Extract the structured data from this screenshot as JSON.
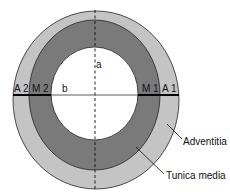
{
  "diagram": {
    "colors": {
      "adventitia": "#c4c4c4",
      "tunica_media": "#7a7a7a",
      "lumen": "#ffffff",
      "stroke": "#222222"
    },
    "layers": [
      {
        "name": "Adventitia",
        "cx": 96,
        "cy": 100,
        "rx": 83,
        "ry": 89
      },
      {
        "name": "Tunica media",
        "cx": 94.5,
        "cy": 95,
        "rx": 65.5,
        "ry": 75
      },
      {
        "name": "Lumen",
        "cx": 94.5,
        "cy": 93.5,
        "rx": 43.5,
        "ry": 46.5
      }
    ],
    "axis_labels": {
      "vertical": "a",
      "horizontal": "b"
    },
    "segment_labels": {
      "a2": "A 2",
      "m2": "M 2",
      "m1": "M 1",
      "a1": "A 1"
    },
    "callouts": {
      "adventitia": "Adventitia",
      "tunica_media": "Tunica media"
    }
  }
}
